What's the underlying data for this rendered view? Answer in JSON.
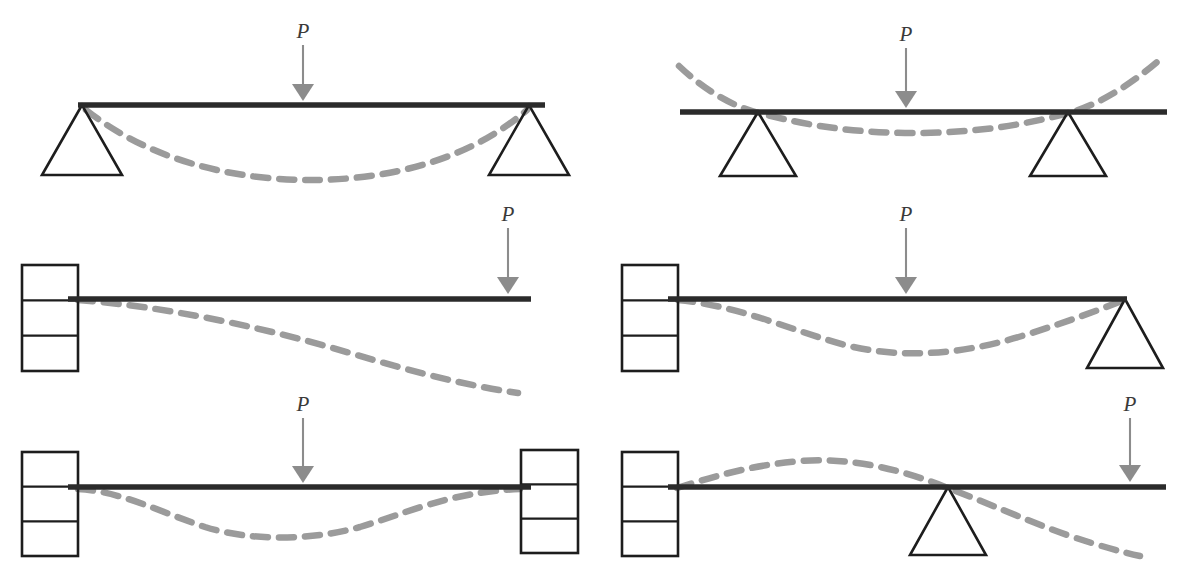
{
  "figure": {
    "background_color": "#ffffff",
    "beam_color": "#2b2b2b",
    "support_color": "#1d1d1d",
    "deflection_color": "#9b9b9b",
    "arrow_color": "#8c8c8c",
    "load_symbol": "P",
    "panel_count": 6,
    "rows": 3,
    "columns": 2
  },
  "panels": [
    {
      "id": "simply-supported",
      "position": "top-left",
      "load_label": "P",
      "load_x": 303,
      "load_arrow_top": 45,
      "load_arrow_bottom": 101,
      "label_x": 303,
      "label_y": 38,
      "beam": {
        "x1": 78,
        "x2": 545,
        "y": 105
      },
      "supports": [
        {
          "type": "pin-triangle",
          "apex_x": 82,
          "apex_y": 105,
          "half_width": 40,
          "base_y": 175
        },
        {
          "type": "pin-triangle",
          "apex_x": 529,
          "apex_y": 105,
          "half_width": 40,
          "base_y": 175
        }
      ],
      "deflection_path": "M 86 110 C 160 168, 250 180, 311 180 C 375 180, 462 166, 527 110"
    },
    {
      "id": "overhanging-both-ends",
      "position": "top-right",
      "load_label": "P",
      "load_x": 906,
      "load_arrow_top": 48,
      "load_arrow_bottom": 108,
      "label_x": 906,
      "label_y": 41,
      "beam": {
        "x1": 680,
        "x2": 1167,
        "y": 112
      },
      "supports": [
        {
          "type": "pin-triangle",
          "apex_x": 758,
          "apex_y": 112,
          "half_width": 38,
          "base_y": 176
        },
        {
          "type": "pin-triangle",
          "apex_x": 1068,
          "apex_y": 112,
          "half_width": 38,
          "base_y": 176
        }
      ],
      "deflection_path": "M 679 66 C 706 92, 737 108, 759 113 C 812 127, 860 133, 913 133 C 966 133, 1018 127, 1068 113 C 1092 107, 1124 90, 1157 62"
    },
    {
      "id": "cantilever-free-end",
      "position": "middle-left",
      "load_label": "P",
      "load_x": 508,
      "load_arrow_top": 228,
      "load_arrow_bottom": 294,
      "label_x": 508,
      "label_y": 221,
      "beam": {
        "x1": 68,
        "x2": 531,
        "y": 299
      },
      "supports": [
        {
          "type": "fixed-wall",
          "x": 22,
          "y": 265,
          "width": 56,
          "height": 106,
          "divisions": 3,
          "beam_row": 1
        }
      ],
      "deflection_path": "M 78 300 C 160 306, 260 326, 350 353 C 420 374, 470 386, 518 393"
    },
    {
      "id": "propped-cantilever",
      "position": "middle-right",
      "load_label": "P",
      "load_x": 906,
      "load_arrow_top": 228,
      "load_arrow_bottom": 294,
      "label_x": 906,
      "label_y": 221,
      "beam": {
        "x1": 668,
        "x2": 1127,
        "y": 299
      },
      "supports": [
        {
          "type": "fixed-wall",
          "x": 622,
          "y": 265,
          "width": 56,
          "height": 106,
          "divisions": 3,
          "beam_row": 1
        },
        {
          "type": "pin-triangle",
          "apex_x": 1125,
          "apex_y": 299,
          "half_width": 38,
          "base_y": 368
        }
      ],
      "deflection_path": "M 678 300 C 740 306, 790 330, 845 345 C 900 359, 960 355, 1022 336 C 1070 321, 1104 308, 1124 300"
    },
    {
      "id": "fixed-fixed",
      "position": "bottom-left",
      "load_label": "P",
      "load_x": 303,
      "load_arrow_top": 418,
      "load_arrow_bottom": 483,
      "label_x": 303,
      "label_y": 411,
      "beam": {
        "x1": 68,
        "x2": 531,
        "y": 487
      },
      "supports": [
        {
          "type": "fixed-wall",
          "x": 22,
          "y": 452,
          "width": 56,
          "height": 104,
          "divisions": 3,
          "beam_row": 1
        },
        {
          "type": "fixed-wall",
          "x": 521,
          "y": 450,
          "width": 57,
          "height": 103,
          "divisions": 3,
          "beam_row": 1
        }
      ],
      "deflection_path": "M 78 489 C 120 491, 160 512, 205 527 C 250 541, 310 541, 360 527 C 410 512, 450 492, 520 489"
    },
    {
      "id": "fixed-with-interior-prop-overhang",
      "position": "bottom-right",
      "load_label": "P",
      "load_x": 1130,
      "load_arrow_top": 418,
      "load_arrow_bottom": 482,
      "label_x": 1130,
      "label_y": 411,
      "beam": {
        "x1": 668,
        "x2": 1166,
        "y": 487
      },
      "supports": [
        {
          "type": "fixed-wall",
          "x": 622,
          "y": 452,
          "width": 56,
          "height": 104,
          "divisions": 3,
          "beam_row": 1
        },
        {
          "type": "pin-triangle",
          "apex_x": 948,
          "apex_y": 487,
          "half_width": 38,
          "base_y": 555
        }
      ],
      "deflection_path": "M 677 488 C 710 478, 745 466, 800 461 C 850 457, 900 469, 948 488 C 990 504, 1030 522, 1070 536 C 1100 546, 1122 552, 1140 556"
    }
  ]
}
